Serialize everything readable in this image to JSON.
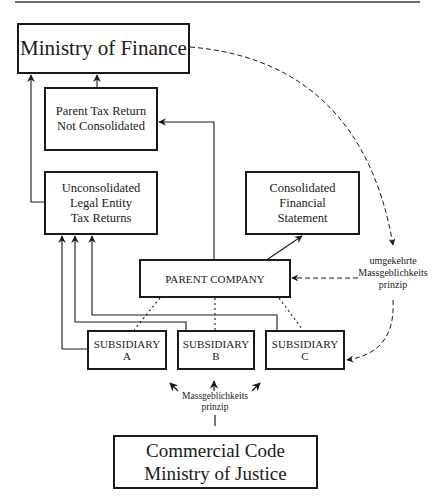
{
  "diagram": {
    "nodes": {
      "ministry_finance": {
        "label": "Ministry of Finance"
      },
      "parent_tax_return": {
        "label": "Parent Tax Return\nNot Consolidated"
      },
      "unconsolidated_returns": {
        "label": "Unconsolidated\nLegal Entity\nTax Returns"
      },
      "consolidated_statement": {
        "label": "Consolidated Financial\nStatement"
      },
      "parent_company": {
        "label": "PARENT COMPANY"
      },
      "subsidiary_a": {
        "label": "SUBSIDIARY A"
      },
      "subsidiary_b": {
        "label": "SUBSIDIARY B"
      },
      "subsidiary_c": {
        "label": "SUBSIDIARY C"
      },
      "commercial_code": {
        "label": "Commercial Code\nMinistry of Justice"
      }
    },
    "annotations": {
      "reverse_principle": "umgekehrte\nMassgeblichkeits\nprinzip",
      "principle": "Massgeblichkeits\nprinzip"
    },
    "edges": [
      {
        "from": "unconsolidated_returns",
        "to": "ministry_finance",
        "style": "solid-arrow"
      },
      {
        "from": "parent_tax_return",
        "to": "ministry_finance",
        "style": "solid-arrow"
      },
      {
        "from": "parent_company",
        "to": "parent_tax_return",
        "style": "solid-arrow"
      },
      {
        "from": "parent_company",
        "to": "consolidated_statement",
        "style": "solid-arrow"
      },
      {
        "from": "subsidiary_a",
        "to": "unconsolidated_returns",
        "style": "solid-arrow"
      },
      {
        "from": "subsidiary_b",
        "to": "unconsolidated_returns",
        "style": "solid-arrow"
      },
      {
        "from": "subsidiary_c",
        "to": "unconsolidated_returns",
        "style": "solid-arrow"
      },
      {
        "from": "parent_company",
        "to": "subsidiary_a",
        "style": "dotted"
      },
      {
        "from": "parent_company",
        "to": "subsidiary_b",
        "style": "dotted"
      },
      {
        "from": "parent_company",
        "to": "subsidiary_c",
        "style": "dotted"
      },
      {
        "from": "ministry_finance",
        "to": "parent_company",
        "style": "dashed-arrow",
        "label": "umgekehrte Massgeblichkeits prinzip"
      },
      {
        "from": "ministry_finance",
        "to": "subsidiary_c",
        "style": "dashed-arrow"
      },
      {
        "from": "commercial_code",
        "to": "subsidiary_a",
        "style": "arrow"
      },
      {
        "from": "commercial_code",
        "to": "subsidiary_b",
        "style": "arrow"
      },
      {
        "from": "commercial_code",
        "to": "subsidiary_c",
        "style": "arrow"
      }
    ],
    "colors": {
      "line": "#1a1a1a",
      "rule": "#6a6a6a",
      "background": "#ffffff"
    }
  }
}
